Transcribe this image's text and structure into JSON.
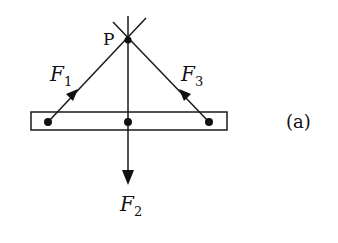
{
  "diagram": {
    "type": "free-body force diagram",
    "point_label": "P",
    "panel_label": "(a)",
    "forces": [
      {
        "symbol": "F",
        "subscript": "1",
        "direction": "up-right toward P",
        "origin": "left end of bar"
      },
      {
        "symbol": "F",
        "subscript": "2",
        "direction": "down",
        "origin": "center of bar"
      },
      {
        "symbol": "F",
        "subscript": "3",
        "direction": "up-left toward P",
        "origin": "right end of bar"
      }
    ],
    "colors": {
      "stroke": "#1a1a1a",
      "background": "#ffffff"
    }
  }
}
